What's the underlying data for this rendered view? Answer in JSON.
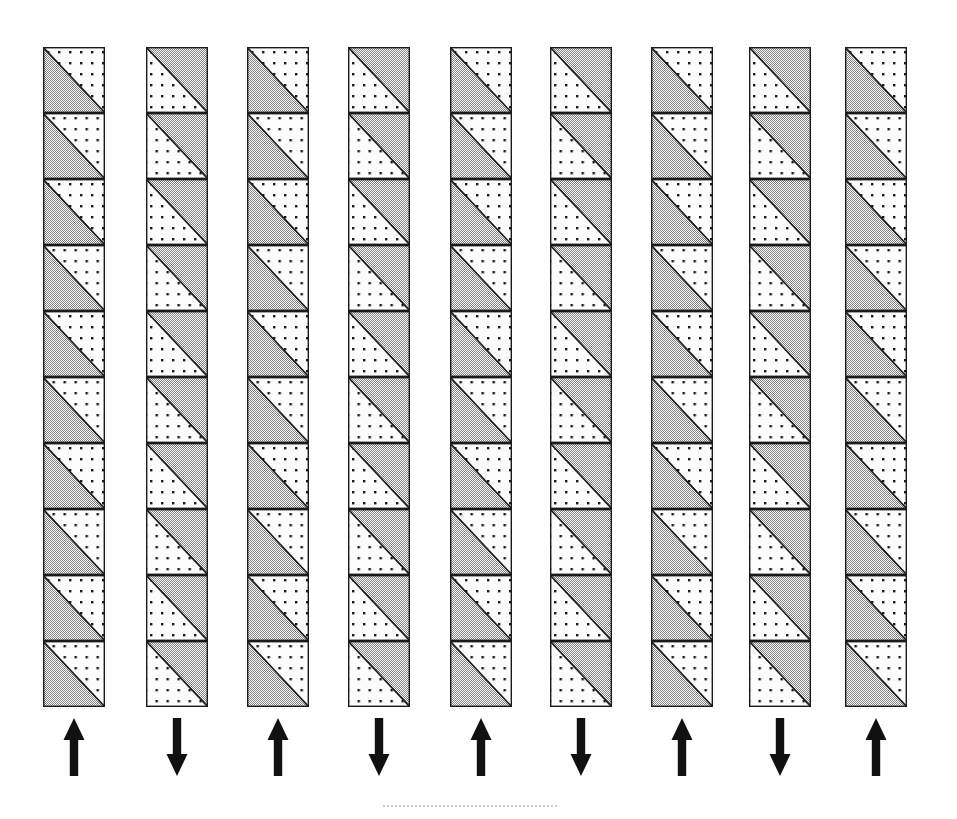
{
  "figure": {
    "canvas": {
      "width": 957,
      "height": 819
    },
    "background_color": "#ffffff",
    "outline_color": "#1a1a1a",
    "gray_fill_color": "#a8a8a8",
    "white_fill_color": "#fbfbfb",
    "dot_color": "#1a1a1a",
    "arrow_color": "#111111",
    "columns_count": 9,
    "cells_per_column": 10,
    "cell_width": 62,
    "cell_height": 66,
    "grid_top": 47,
    "grid_bottom": 710,
    "column_x_positions": [
      43,
      146,
      247,
      348,
      450,
      550,
      651,
      749,
      845
    ],
    "diagonal_direction": "top-left-to-bottom-right",
    "columns": [
      {
        "index": 1,
        "label": "column-1",
        "x": 43,
        "gray_region": "lower-left",
        "white_region": "upper-right",
        "arrow": "up",
        "arrow_glyph": "↑",
        "arrow_label": "up"
      },
      {
        "index": 2,
        "label": "column-2",
        "x": 146,
        "gray_region": "upper-right",
        "white_region": "lower-left",
        "arrow": "down",
        "arrow_glyph": "↓",
        "arrow_label": "down"
      },
      {
        "index": 3,
        "label": "column-3",
        "x": 247,
        "gray_region": "lower-left",
        "white_region": "upper-right",
        "arrow": "up",
        "arrow_glyph": "↑",
        "arrow_label": "up"
      },
      {
        "index": 4,
        "label": "column-4",
        "x": 348,
        "gray_region": "upper-right",
        "white_region": "lower-left",
        "arrow": "down",
        "arrow_glyph": "↓",
        "arrow_label": "down"
      },
      {
        "index": 5,
        "label": "column-5",
        "x": 450,
        "gray_region": "lower-left",
        "white_region": "upper-right",
        "arrow": "up",
        "arrow_glyph": "↑",
        "arrow_label": "up"
      },
      {
        "index": 6,
        "label": "column-6",
        "x": 550,
        "gray_region": "upper-right",
        "white_region": "lower-left",
        "arrow": "down",
        "arrow_glyph": "↓",
        "arrow_label": "down"
      },
      {
        "index": 7,
        "label": "column-7",
        "x": 651,
        "gray_region": "lower-left",
        "white_region": "upper-right",
        "arrow": "up",
        "arrow_glyph": "↑",
        "arrow_label": "up"
      },
      {
        "index": 8,
        "label": "column-8",
        "x": 749,
        "gray_region": "upper-right",
        "white_region": "lower-left",
        "arrow": "down",
        "arrow_glyph": "↓",
        "arrow_label": "down"
      },
      {
        "index": 9,
        "label": "column-9",
        "x": 845,
        "gray_region": "lower-left",
        "white_region": "upper-right",
        "arrow": "up",
        "arrow_glyph": "↑",
        "arrow_label": "up"
      }
    ],
    "arrow_row": {
      "y": 718,
      "height": 58,
      "width": 26,
      "sequence": [
        "up",
        "down",
        "up",
        "down",
        "up",
        "down",
        "up",
        "down",
        "up"
      ]
    },
    "baseline_rule": {
      "x": 383,
      "y": 805,
      "width": 175,
      "style": "dotted"
    }
  }
}
